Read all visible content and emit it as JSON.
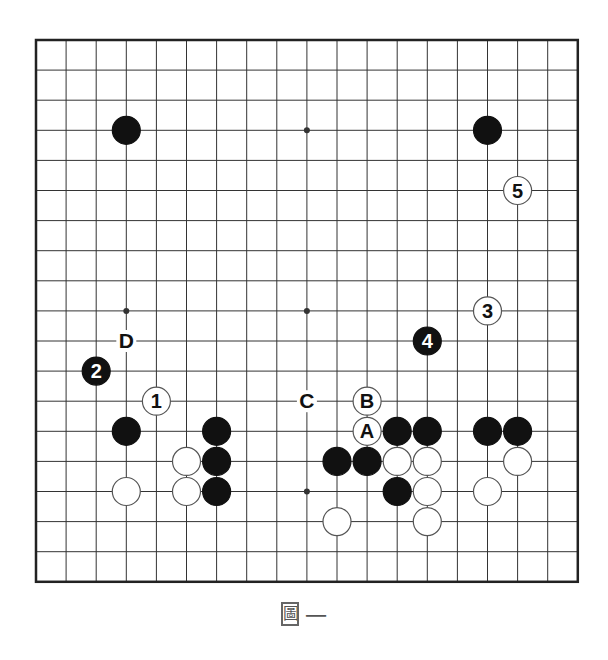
{
  "diagram": {
    "type": "go-board",
    "size": 19,
    "caption": "圖一",
    "caption_chars": [
      "圖",
      "一"
    ],
    "colors": {
      "background": "#ffffff",
      "grid": "#333333",
      "border": "#222222",
      "black_stone": "#111111",
      "white_stone": "#ffffff",
      "white_outline": "#555555",
      "label": "#111111"
    },
    "geometry": {
      "origin_x": 36,
      "origin_y": 40,
      "spacing": 30.1,
      "stone_radius": 14
    },
    "star_points": [
      [
        3,
        3
      ],
      [
        9,
        3
      ],
      [
        15,
        3
      ],
      [
        3,
        9
      ],
      [
        9,
        9
      ],
      [
        15,
        9
      ],
      [
        3,
        15
      ],
      [
        9,
        15
      ],
      [
        15,
        15
      ]
    ],
    "stones": [
      {
        "col": 3,
        "row": 3,
        "color": "black",
        "label": ""
      },
      {
        "col": 15,
        "row": 3,
        "color": "black",
        "label": ""
      },
      {
        "col": 3,
        "row": 13,
        "color": "black",
        "label": ""
      },
      {
        "col": 6,
        "row": 13,
        "color": "black",
        "label": ""
      },
      {
        "col": 6,
        "row": 14,
        "color": "black",
        "label": ""
      },
      {
        "col": 6,
        "row": 15,
        "color": "black",
        "label": ""
      },
      {
        "col": 5,
        "row": 14,
        "color": "white",
        "label": ""
      },
      {
        "col": 5,
        "row": 15,
        "color": "white",
        "label": ""
      },
      {
        "col": 3,
        "row": 15,
        "color": "white",
        "label": ""
      },
      {
        "col": 12,
        "row": 13,
        "color": "black",
        "label": ""
      },
      {
        "col": 13,
        "row": 13,
        "color": "black",
        "label": ""
      },
      {
        "col": 10,
        "row": 14,
        "color": "black",
        "label": ""
      },
      {
        "col": 11,
        "row": 14,
        "color": "black",
        "label": ""
      },
      {
        "col": 12,
        "row": 14,
        "color": "white",
        "label": ""
      },
      {
        "col": 13,
        "row": 14,
        "color": "white",
        "label": ""
      },
      {
        "col": 12,
        "row": 15,
        "color": "black",
        "label": ""
      },
      {
        "col": 13,
        "row": 15,
        "color": "white",
        "label": ""
      },
      {
        "col": 10,
        "row": 16,
        "color": "white",
        "label": ""
      },
      {
        "col": 13,
        "row": 16,
        "color": "white",
        "label": ""
      },
      {
        "col": 15,
        "row": 13,
        "color": "black",
        "label": ""
      },
      {
        "col": 16,
        "row": 13,
        "color": "black",
        "label": ""
      },
      {
        "col": 16,
        "row": 14,
        "color": "white",
        "label": ""
      },
      {
        "col": 15,
        "row": 15,
        "color": "white",
        "label": ""
      },
      {
        "col": 4,
        "row": 12,
        "color": "white",
        "label": "1"
      },
      {
        "col": 2,
        "row": 11,
        "color": "black",
        "label": "2"
      },
      {
        "col": 15,
        "row": 9,
        "color": "white",
        "label": "3"
      },
      {
        "col": 13,
        "row": 10,
        "color": "black",
        "label": "4"
      },
      {
        "col": 16,
        "row": 5,
        "color": "white",
        "label": "5"
      },
      {
        "col": 11,
        "row": 13,
        "color": "white",
        "label": "A"
      },
      {
        "col": 11,
        "row": 12,
        "color": "white",
        "label": "B"
      }
    ],
    "point_labels": [
      {
        "col": 9,
        "row": 12,
        "label": "C"
      },
      {
        "col": 3,
        "row": 10,
        "label": "D"
      }
    ]
  }
}
